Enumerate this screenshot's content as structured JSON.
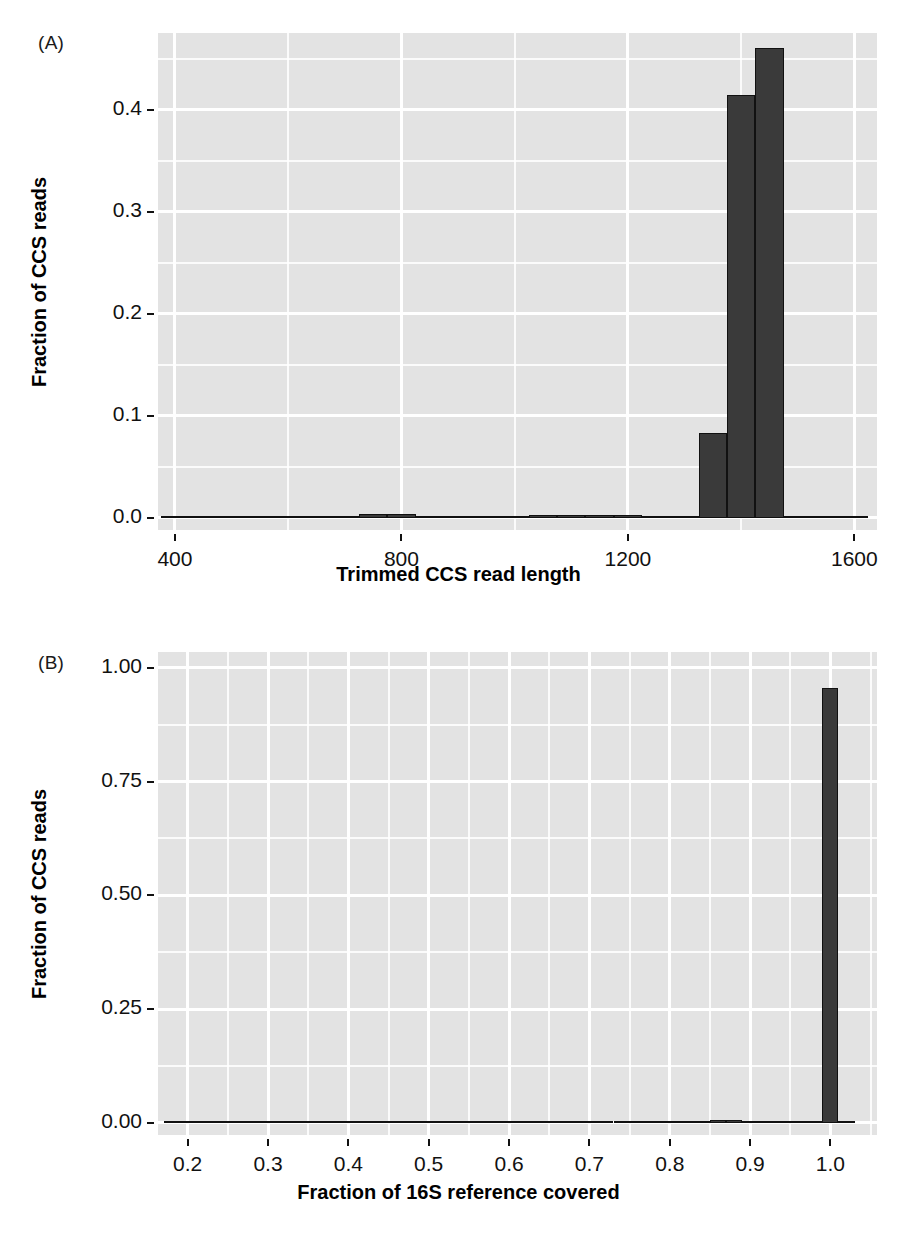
{
  "figure": {
    "panel_a_tag": "(A)",
    "panel_b_tag": "(B)"
  },
  "chart_data": [
    {
      "id": "panel-a",
      "panel_label": "(A)",
      "type": "bar",
      "title": "",
      "xlabel": "Trimmed CCS read length",
      "ylabel": "Fraction of CCS reads",
      "xlim": [
        370,
        1640
      ],
      "ylim": [
        -0.012,
        0.475
      ],
      "xticks": [
        400,
        800,
        1200,
        1600
      ],
      "xtick_labels": [
        "400",
        "800",
        "1200",
        "1600"
      ],
      "yticks": [
        0.0,
        0.1,
        0.2,
        0.3,
        0.4
      ],
      "ytick_labels": [
        "0.0",
        "0.1",
        "0.2",
        "0.3",
        "0.4"
      ],
      "grid": true,
      "grid_minor": true,
      "legend": "none",
      "bin_width": 50,
      "bins": [
        {
          "x0": 375,
          "x1": 425,
          "value": 0.0005
        },
        {
          "x0": 425,
          "x1": 475,
          "value": 0.0006
        },
        {
          "x0": 475,
          "x1": 525,
          "value": 0.0007
        },
        {
          "x0": 525,
          "x1": 575,
          "value": 0.0008
        },
        {
          "x0": 575,
          "x1": 625,
          "value": 0.0009
        },
        {
          "x0": 625,
          "x1": 675,
          "value": 0.0011
        },
        {
          "x0": 675,
          "x1": 725,
          "value": 0.0022
        },
        {
          "x0": 725,
          "x1": 775,
          "value": 0.0035
        },
        {
          "x0": 775,
          "x1": 825,
          "value": 0.0036
        },
        {
          "x0": 825,
          "x1": 875,
          "value": 0.002
        },
        {
          "x0": 875,
          "x1": 925,
          "value": 0.0018
        },
        {
          "x0": 925,
          "x1": 975,
          "value": 0.0019
        },
        {
          "x0": 975,
          "x1": 1025,
          "value": 0.0021
        },
        {
          "x0": 1025,
          "x1": 1075,
          "value": 0.0031
        },
        {
          "x0": 1075,
          "x1": 1125,
          "value": 0.0028
        },
        {
          "x0": 1125,
          "x1": 1175,
          "value": 0.003
        },
        {
          "x0": 1175,
          "x1": 1225,
          "value": 0.0027
        },
        {
          "x0": 1225,
          "x1": 1275,
          "value": 0.0016
        },
        {
          "x0": 1275,
          "x1": 1325,
          "value": 0.0014
        },
        {
          "x0": 1325,
          "x1": 1375,
          "value": 0.083
        },
        {
          "x0": 1375,
          "x1": 1425,
          "value": 0.414
        },
        {
          "x0": 1425,
          "x1": 1475,
          "value": 0.46
        },
        {
          "x0": 1475,
          "x1": 1525,
          "value": 0.0018
        },
        {
          "x0": 1525,
          "x1": 1575,
          "value": 0.0014
        },
        {
          "x0": 1575,
          "x1": 1625,
          "value": 0.0012
        }
      ]
    },
    {
      "id": "panel-b",
      "panel_label": "(B)",
      "type": "bar",
      "title": "",
      "xlabel": "Fraction of 16S reference covered",
      "ylabel": "Fraction of CCS reads",
      "xlim": [
        0.163,
        1.058
      ],
      "ylim": [
        -0.027,
        1.035
      ],
      "xticks": [
        0.2,
        0.3,
        0.4,
        0.5,
        0.6,
        0.7,
        0.8,
        0.9,
        1.0
      ],
      "xtick_labels": [
        "0.2",
        "0.3",
        "0.4",
        "0.5",
        "0.6",
        "0.7",
        "0.8",
        "0.9",
        "1.0"
      ],
      "yticks": [
        0.0,
        0.25,
        0.5,
        0.75,
        1.0
      ],
      "ytick_labels": [
        "0.00",
        "0.25",
        "0.50",
        "0.75",
        "1.00"
      ],
      "grid": true,
      "grid_minor": true,
      "legend": "none",
      "bin_width": 0.02,
      "bins": [
        {
          "x0": 0.17,
          "x1": 0.19,
          "value": 0.0004
        },
        {
          "x0": 0.19,
          "x1": 0.21,
          "value": 0.0004
        },
        {
          "x0": 0.21,
          "x1": 0.23,
          "value": 0.0004
        },
        {
          "x0": 0.23,
          "x1": 0.25,
          "value": 0.0004
        },
        {
          "x0": 0.25,
          "x1": 0.27,
          "value": 0.0005
        },
        {
          "x0": 0.27,
          "x1": 0.29,
          "value": 0.0005
        },
        {
          "x0": 0.29,
          "x1": 0.31,
          "value": 0.0005
        },
        {
          "x0": 0.31,
          "x1": 0.33,
          "value": 0.0005
        },
        {
          "x0": 0.33,
          "x1": 0.35,
          "value": 0.0005
        },
        {
          "x0": 0.35,
          "x1": 0.37,
          "value": 0.0006
        },
        {
          "x0": 0.37,
          "x1": 0.39,
          "value": 0.0006
        },
        {
          "x0": 0.39,
          "x1": 0.41,
          "value": 0.0006
        },
        {
          "x0": 0.41,
          "x1": 0.43,
          "value": 0.0007
        },
        {
          "x0": 0.43,
          "x1": 0.45,
          "value": 0.0007
        },
        {
          "x0": 0.45,
          "x1": 0.47,
          "value": 0.0008
        },
        {
          "x0": 0.47,
          "x1": 0.49,
          "value": 0.0026
        },
        {
          "x0": 0.49,
          "x1": 0.51,
          "value": 0.0028
        },
        {
          "x0": 0.51,
          "x1": 0.53,
          "value": 0.001
        },
        {
          "x0": 0.53,
          "x1": 0.55,
          "value": 0.0009
        },
        {
          "x0": 0.55,
          "x1": 0.57,
          "value": 0.0009
        },
        {
          "x0": 0.57,
          "x1": 0.59,
          "value": 0.001
        },
        {
          "x0": 0.59,
          "x1": 0.61,
          "value": 0.0027
        },
        {
          "x0": 0.61,
          "x1": 0.63,
          "value": 0.0025
        },
        {
          "x0": 0.63,
          "x1": 0.65,
          "value": 0.0024
        },
        {
          "x0": 0.65,
          "x1": 0.67,
          "value": 0.001
        },
        {
          "x0": 0.67,
          "x1": 0.69,
          "value": 0.001
        },
        {
          "x0": 0.69,
          "x1": 0.71,
          "value": 0.0011
        },
        {
          "x0": 0.71,
          "x1": 0.73,
          "value": 0.0023
        },
        {
          "x0": 0.73,
          "x1": 0.75,
          "value": 0.0024
        },
        {
          "x0": 0.75,
          "x1": 0.77,
          "value": 0.0013
        },
        {
          "x0": 0.77,
          "x1": 0.79,
          "value": 0.0026
        },
        {
          "x0": 0.79,
          "x1": 0.81,
          "value": 0.0028
        },
        {
          "x0": 0.81,
          "x1": 0.83,
          "value": 0.003
        },
        {
          "x0": 0.83,
          "x1": 0.85,
          "value": 0.0032
        },
        {
          "x0": 0.85,
          "x1": 0.87,
          "value": 0.005
        },
        {
          "x0": 0.87,
          "x1": 0.89,
          "value": 0.0052
        },
        {
          "x0": 0.89,
          "x1": 0.91,
          "value": 0.0024
        },
        {
          "x0": 0.91,
          "x1": 0.93,
          "value": 0.0026
        },
        {
          "x0": 0.93,
          "x1": 0.95,
          "value": 0.0028
        },
        {
          "x0": 0.95,
          "x1": 0.97,
          "value": 0.0036
        },
        {
          "x0": 0.97,
          "x1": 0.99,
          "value": 0.004
        },
        {
          "x0": 0.99,
          "x1": 1.01,
          "value": 0.955
        },
        {
          "x0": 1.01,
          "x1": 1.03,
          "value": 0.0008
        }
      ]
    }
  ],
  "style": {
    "panel_background": "#e3e3e3",
    "grid_color": "#ffffff",
    "bar_fill": "#3a3a3a",
    "bar_stroke": "#111111",
    "text_color": "#111111"
  }
}
